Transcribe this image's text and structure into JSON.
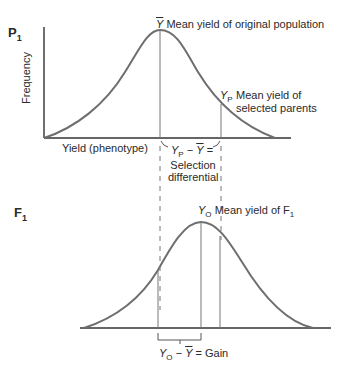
{
  "panels": {
    "parent": {
      "generation": "P",
      "generation_sub": "1",
      "y_axis_label": "Frequency",
      "x_axis_label": "Yield (phenotype)",
      "mean_symbol": "Y",
      "mean_label": "Mean yield of original population",
      "selected_symbol": "Y",
      "selected_sub": "P",
      "selected_label_line1": "Mean yield of",
      "selected_label_line2": "selected parents",
      "diff_eq_y": "Y",
      "diff_eq_sub": "P",
      "diff_eq_rest": " − ",
      "diff_eq_bar": "Y",
      "diff_eq_end": " =",
      "diff_line1": "Selection",
      "diff_line2": "differential"
    },
    "offspring": {
      "generation": "F",
      "generation_sub": "1",
      "mean_symbol": "Y",
      "mean_sub": "O",
      "mean_label": "Mean yield of F",
      "mean_label_sub": "1",
      "gain_y": "Y",
      "gain_sub": "O",
      "gain_minus": " − ",
      "gain_bar": "Y",
      "gain_end": " = Gain"
    }
  },
  "colors": {
    "curve": "#6e6e6e",
    "axis": "#333333",
    "text": "#2a2a2a"
  }
}
